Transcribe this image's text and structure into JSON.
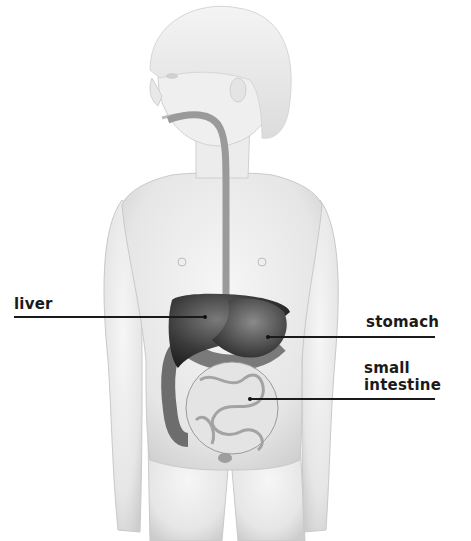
{
  "diagram": {
    "labels": [
      {
        "id": "liver",
        "text": "liver"
      },
      {
        "id": "stomach",
        "text": "stomach"
      },
      {
        "id": "small-intestine",
        "lines": [
          "small",
          "intestine"
        ]
      }
    ],
    "colors": {
      "background": "#ffffff",
      "skin": "#ececec",
      "skin_shadow": "#cfcfcf",
      "organ_dark": "#3a3a3a",
      "intestine": "#e2e2e2",
      "colon": "#6d6d6d",
      "label": "#1a1a1a"
    }
  }
}
